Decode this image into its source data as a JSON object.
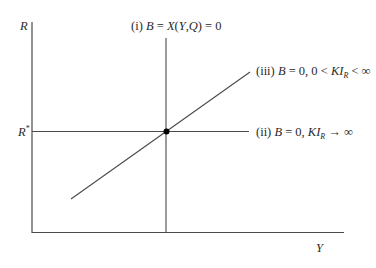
{
  "diagram": {
    "type": "economics-curve-diagram",
    "axes": {
      "y_label": "R",
      "x_label": "Y",
      "y_tick_label": "R",
      "y_tick_superscript": "*"
    },
    "curves": [
      {
        "id": "i",
        "prefix": "(i) ",
        "var_b": "B",
        "eq1": " = ",
        "func": "X",
        "args_open": "(",
        "arg1": "Y",
        "comma": ",",
        "arg2": "Q",
        "args_close": ")",
        "eq2": " = 0",
        "orientation": "vertical"
      },
      {
        "id": "ii",
        "prefix": "(ii) ",
        "var_b": "B",
        "eq": " = 0, ",
        "ki": "KI",
        "sub": "R",
        "tail": " → ∞",
        "orientation": "horizontal"
      },
      {
        "id": "iii",
        "prefix": "(iii) ",
        "var_b": "B",
        "eq": " = 0, 0 < ",
        "ki": "KI",
        "sub": "R",
        "tail": " < ∞",
        "orientation": "upward-sloping"
      }
    ],
    "equilibrium_point": {
      "label": "equilibrium",
      "x": 166,
      "y": 131
    },
    "colors": {
      "line": "#4a4a4a",
      "point": "#000000",
      "text": "#2a2a2a"
    }
  }
}
